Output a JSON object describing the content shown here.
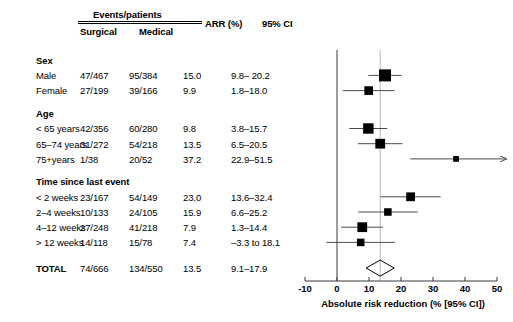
{
  "header": {
    "group_label": "Events/patients",
    "col_surgical": "Surgical",
    "col_medical": "Medical",
    "col_arr": "ARR (%)",
    "col_ci": "95% CI"
  },
  "axis": {
    "title": "Absolute risk reduction (% [95% CI])",
    "ticks": [
      "-10",
      "0",
      "10",
      "20",
      "30",
      "40",
      "50"
    ],
    "tick_values": [
      -10,
      0,
      10,
      20,
      30,
      40,
      50
    ],
    "min": -10,
    "max": 50,
    "reference_line_value": 13.5,
    "zero_line_value": 0
  },
  "groups": [
    {
      "title": "Sex",
      "rows": [
        {
          "label": "Male",
          "surgical": "47/467",
          "medical": "95/384",
          "arr": "15.0",
          "ci": "9.8– 20.2",
          "value": 15.0,
          "lo": 9.8,
          "hi": 20.2,
          "weight": 1.0
        },
        {
          "label": "Female",
          "surgical": "27/199",
          "medical": "39/166",
          "arr": "9.9",
          "ci": "1.8–18.0",
          "value": 9.9,
          "lo": 1.8,
          "hi": 18.0,
          "weight": 0.58
        }
      ]
    },
    {
      "title": "Age",
      "rows": [
        {
          "label": "< 65 years",
          "surgical": "42/356",
          "medical": "60/280",
          "arr": "9.8",
          "ci": "3.8–15.7",
          "value": 9.8,
          "lo": 3.8,
          "hi": 15.7,
          "weight": 0.8
        },
        {
          "label": "65–74 years",
          "surgical": "31/272",
          "medical": "54/218",
          "arr": "13.5",
          "ci": "6.5–20.5",
          "value": 13.5,
          "lo": 6.5,
          "hi": 20.5,
          "weight": 0.72
        },
        {
          "label": "75+years",
          "surgical": "1/38",
          "medical": "20/52",
          "arr": "37.2",
          "ci": "22.9–51.5",
          "value": 37.2,
          "lo": 22.9,
          "hi": 51.5,
          "weight": 0.22,
          "arrow_right": true
        }
      ]
    },
    {
      "title": "Time since last event",
      "rows": [
        {
          "label": "< 2 weeks",
          "surgical": "23/167",
          "medical": "54/149",
          "arr": "23.0",
          "ci": "13.6–32.4",
          "value": 23.0,
          "lo": 13.6,
          "hi": 32.4,
          "weight": 0.6
        },
        {
          "label": "2–4 weeks",
          "surgical": "10/133",
          "medical": "24/105",
          "arr": "15.9",
          "ci": "6.6–25.2",
          "value": 15.9,
          "lo": 6.6,
          "hi": 25.2,
          "weight": 0.44
        },
        {
          "label": "4–12 weeks",
          "surgical": "27/248",
          "medical": "41/218",
          "arr": "7.9",
          "ci": "1.3–14.4",
          "value": 7.9,
          "lo": 1.3,
          "hi": 14.4,
          "weight": 0.72
        },
        {
          "label": "> 12 weeks",
          "surgical": "14/118",
          "medical": "15/78",
          "arr": "7.4",
          "ci": "–3.3 to 18.1",
          "value": 7.4,
          "lo": -3.3,
          "hi": 18.1,
          "weight": 0.44
        }
      ]
    }
  ],
  "total": {
    "label": "TOTAL",
    "surgical": "74/666",
    "medical": "134/550",
    "arr": "13.5",
    "ci": "9.1–17.9",
    "value": 13.5,
    "lo": 9.1,
    "hi": 17.9
  },
  "colors": {
    "marker": "#000000",
    "line": "#4d4d4d",
    "reference_line": "#b8b8b8",
    "axis": "#3a3a3a",
    "text": "#000000"
  }
}
